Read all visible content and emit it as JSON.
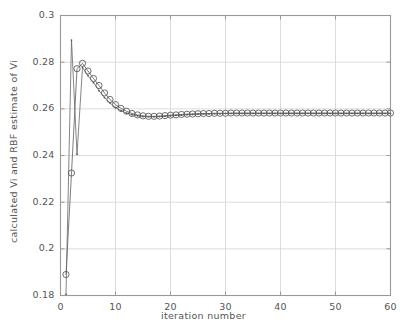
{
  "chart_data": {
    "type": "line",
    "title": "",
    "xlabel": "iteration number",
    "ylabel": "calculated Vi and RBF estimate of Vi",
    "xlim": [
      0,
      60
    ],
    "ylim": [
      0.18,
      0.3
    ],
    "xticks": [
      0,
      10,
      20,
      30,
      40,
      50,
      60
    ],
    "yticks": [
      0.18,
      0.2,
      0.22,
      0.24,
      0.26,
      0.28,
      0.3
    ],
    "xtick_labels": [
      "0",
      "10",
      "20",
      "30",
      "40",
      "50",
      "60"
    ],
    "ytick_labels": [
      "0.18",
      "0.2",
      "0.22",
      "0.24",
      "0.26",
      "0.28",
      "0.3"
    ],
    "grid": true,
    "legend": "none",
    "colors": {
      "line": "#666666",
      "marker": "#555555",
      "grid": "#d8d8d8",
      "axis": "#999999",
      "background": "#ffffff"
    },
    "x": [
      1,
      2,
      3,
      4,
      5,
      6,
      7,
      8,
      9,
      10,
      11,
      12,
      13,
      14,
      15,
      16,
      17,
      18,
      19,
      20,
      21,
      22,
      23,
      24,
      25,
      26,
      27,
      28,
      29,
      30,
      31,
      32,
      33,
      34,
      35,
      36,
      37,
      38,
      39,
      40,
      41,
      42,
      43,
      44,
      45,
      46,
      47,
      48,
      49,
      50,
      51,
      52,
      53,
      54,
      55,
      56,
      57,
      58,
      59,
      60
    ],
    "series": [
      {
        "name": "calculated Vi",
        "marker": "dot",
        "values": [
          0.1805,
          0.2895,
          0.2405,
          0.2778,
          0.2742,
          0.2712,
          0.2678,
          0.2648,
          0.2625,
          0.2605,
          0.2592,
          0.2582,
          0.2575,
          0.257,
          0.2567,
          0.2566,
          0.2566,
          0.2567,
          0.2568,
          0.257,
          0.2572,
          0.2573,
          0.2575,
          0.2576,
          0.2577,
          0.2578,
          0.2578,
          0.2579,
          0.2579,
          0.258,
          0.258,
          0.258,
          0.258,
          0.258,
          0.258,
          0.258,
          0.258,
          0.258,
          0.258,
          0.258,
          0.258,
          0.258,
          0.258,
          0.258,
          0.258,
          0.258,
          0.258,
          0.258,
          0.258,
          0.258,
          0.258,
          0.258,
          0.258,
          0.258,
          0.258,
          0.258,
          0.258,
          0.258,
          0.258,
          0.258
        ]
      },
      {
        "name": "RBF estimate of Vi",
        "marker": "circle",
        "values": [
          0.189,
          0.2325,
          0.2772,
          0.2795,
          0.2762,
          0.273,
          0.27,
          0.2668,
          0.264,
          0.2618,
          0.2602,
          0.259,
          0.258,
          0.2574,
          0.257,
          0.2568,
          0.2568,
          0.2569,
          0.2571,
          0.2573,
          0.2574,
          0.2576,
          0.2577,
          0.2578,
          0.2579,
          0.258,
          0.258,
          0.2581,
          0.2581,
          0.2581,
          0.2582,
          0.2582,
          0.2582,
          0.2582,
          0.2582,
          0.2582,
          0.2582,
          0.2582,
          0.2582,
          0.2582,
          0.2582,
          0.2582,
          0.2582,
          0.2582,
          0.2582,
          0.2582,
          0.2582,
          0.2582,
          0.2582,
          0.2582,
          0.2582,
          0.2582,
          0.2582,
          0.2582,
          0.2582,
          0.2582,
          0.2582,
          0.2582,
          0.2582,
          0.2582
        ]
      }
    ]
  }
}
